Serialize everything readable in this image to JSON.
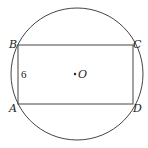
{
  "diagram": {
    "type": "rectangle-inscribed-in-circle",
    "circle": {
      "center_label": "O",
      "cx": 77,
      "cy": 74,
      "r": 66
    },
    "rectangle": {
      "vertices": [
        {
          "label": "B",
          "x": 18,
          "y": 45
        },
        {
          "label": "C",
          "x": 133,
          "y": 45
        },
        {
          "label": "D",
          "x": 133,
          "y": 104
        },
        {
          "label": "A",
          "x": 18,
          "y": 104
        }
      ],
      "side_label": {
        "side": "AB",
        "text": "6"
      }
    },
    "colors": {
      "stroke": "#444444",
      "text": "#222222",
      "background": "#ffffff"
    }
  },
  "labels": {
    "B": "B",
    "C": "C",
    "A": "A",
    "D": "D",
    "O": "O",
    "side_AB": "6"
  }
}
